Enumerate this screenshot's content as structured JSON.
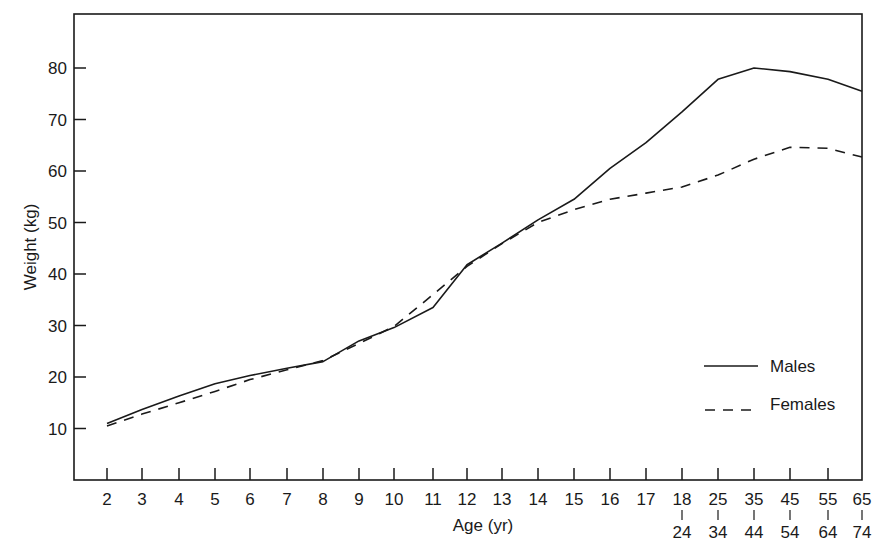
{
  "chart_data": {
    "type": "line",
    "title": "",
    "xlabel": "Age (yr)",
    "ylabel": "Weight (kg)",
    "ylim": [
      0,
      90
    ],
    "yticks": [
      10,
      20,
      30,
      40,
      50,
      60,
      70,
      80
    ],
    "grid": false,
    "legend_position": "lower right (inside plot)",
    "categories": [
      "2",
      "3",
      "4",
      "5",
      "6",
      "7",
      "8",
      "9",
      "10",
      "11",
      "12",
      "13",
      "14",
      "15",
      "16",
      "17",
      "18–24",
      "25–34",
      "35–44",
      "45–54",
      "55–64",
      "65–74"
    ],
    "category_labels_top": [
      "2",
      "3",
      "4",
      "5",
      "6",
      "7",
      "8",
      "9",
      "10",
      "11",
      "12",
      "13",
      "14",
      "15",
      "16",
      "17",
      "18",
      "25",
      "35",
      "45",
      "55",
      "65"
    ],
    "category_labels_bottom": [
      "",
      "",
      "",
      "",
      "",
      "",
      "",
      "",
      "",
      "",
      "",
      "",
      "",
      "",
      "",
      "",
      "24",
      "34",
      "44",
      "54",
      "64",
      "74"
    ],
    "series": [
      {
        "name": "Males",
        "style": "solid",
        "values": [
          11.0,
          13.7,
          16.3,
          18.7,
          20.3,
          21.7,
          23.0,
          27.0,
          29.6,
          33.5,
          41.8,
          46.0,
          50.5,
          54.5,
          60.5,
          65.5,
          71.5,
          77.8,
          80.0,
          79.3,
          77.8,
          75.5
        ]
      },
      {
        "name": "Females",
        "style": "dashed",
        "values": [
          10.5,
          12.8,
          15.0,
          17.2,
          19.5,
          21.4,
          23.2,
          26.5,
          29.8,
          36.0,
          41.5,
          45.9,
          50.0,
          52.5,
          54.5,
          55.7,
          56.9,
          59.2,
          62.3,
          64.6,
          64.4,
          62.7
        ]
      }
    ]
  },
  "legend": {
    "males_label": "Males",
    "females_label": "Females"
  },
  "colors": {
    "line": "#1a1a1a",
    "background": "#ffffff"
  }
}
